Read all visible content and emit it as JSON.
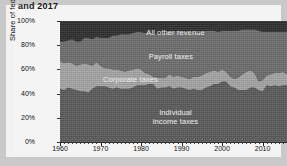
{
  "title": "and 2017",
  "chart_data": {
    "type": "area",
    "title": "and 2017",
    "xlabel": "",
    "ylabel": "Share of federal revenue",
    "xlim": [
      1960,
      2017
    ],
    "ylim": [
      0,
      100
    ],
    "grid": false,
    "legend_position": "inline-labels",
    "stacked": true,
    "x_ticks": [
      "1960",
      "1970",
      "1980",
      "1990",
      "2000",
      "2010"
    ],
    "x_tick_values": [
      1960,
      1970,
      1980,
      1990,
      2000,
      2010
    ],
    "y_ticks": [
      "0%",
      "20%",
      "40%",
      "60%",
      "80%",
      "100%"
    ],
    "y_tick_values": [
      0,
      20,
      40,
      60,
      80,
      100
    ],
    "x": [
      1960,
      1961,
      1962,
      1963,
      1964,
      1965,
      1966,
      1967,
      1968,
      1969,
      1970,
      1971,
      1972,
      1973,
      1974,
      1975,
      1976,
      1977,
      1978,
      1979,
      1980,
      1981,
      1982,
      1983,
      1984,
      1985,
      1986,
      1987,
      1988,
      1989,
      1990,
      1991,
      1992,
      1993,
      1994,
      1995,
      1996,
      1997,
      1998,
      1999,
      2000,
      2001,
      2002,
      2003,
      2004,
      2005,
      2006,
      2007,
      2008,
      2009,
      2010,
      2011,
      2012,
      2013,
      2014,
      2015,
      2016,
      2017
    ],
    "series": [
      {
        "name": "Individual income taxes",
        "color": "#5b5b5b",
        "label_position": "bottom",
        "values": [
          44,
          43,
          45,
          44,
          43,
          42,
          42,
          41,
          44,
          46,
          46,
          46,
          45,
          44,
          45,
          44,
          44,
          44,
          45,
          47,
          47,
          47,
          48,
          48,
          44,
          45,
          45,
          46,
          44,
          45,
          45,
          44,
          43,
          44,
          43,
          43,
          45,
          46,
          48,
          48,
          50,
          50,
          46,
          45,
          43,
          43,
          43,
          45,
          45,
          43,
          42,
          47,
          46,
          47,
          46,
          47,
          47,
          48
        ]
      },
      {
        "name": "Corporate taxes",
        "color": "#a6a6a6",
        "label_position": "middle",
        "values": [
          23,
          22,
          21,
          21,
          20,
          22,
          23,
          23,
          19,
          20,
          17,
          15,
          16,
          16,
          15,
          15,
          14,
          15,
          15,
          14,
          13,
          10,
          8,
          6,
          9,
          8,
          8,
          10,
          10,
          10,
          9,
          9,
          9,
          10,
          11,
          12,
          12,
          12,
          11,
          10,
          10,
          8,
          8,
          7,
          10,
          13,
          15,
          14,
          12,
          7,
          9,
          8,
          10,
          10,
          11,
          11,
          9,
          9
        ]
      },
      {
        "name": "Payroll taxes",
        "color": "#6e6e6e",
        "label_position": "upper",
        "values": [
          16,
          18,
          18,
          20,
          20,
          19,
          21,
          22,
          22,
          21,
          23,
          25,
          25,
          28,
          28,
          30,
          31,
          30,
          30,
          30,
          31,
          33,
          35,
          35,
          36,
          36,
          37,
          35,
          37,
          37,
          37,
          38,
          38,
          37,
          36,
          35,
          35,
          34,
          33,
          33,
          32,
          34,
          38,
          40,
          39,
          37,
          35,
          34,
          36,
          42,
          40,
          36,
          35,
          34,
          34,
          33,
          35,
          35
        ]
      },
      {
        "name": "All other revenue",
        "color": "#2f2f2f",
        "label_position": "top",
        "values": [
          17,
          17,
          16,
          15,
          17,
          17,
          14,
          14,
          15,
          13,
          14,
          14,
          14,
          12,
          12,
          11,
          11,
          11,
          10,
          9,
          9,
          10,
          9,
          11,
          11,
          11,
          10,
          9,
          9,
          8,
          9,
          9,
          10,
          9,
          10,
          10,
          8,
          8,
          8,
          9,
          8,
          8,
          8,
          8,
          8,
          7,
          7,
          7,
          7,
          8,
          9,
          9,
          9,
          9,
          9,
          9,
          9,
          8
        ]
      }
    ],
    "band_labels": [
      {
        "text": "All other revenue",
        "x_frac": 0.5,
        "y_frac": 0.055
      },
      {
        "text": "Payroll taxes",
        "x_frac": 0.48,
        "y_frac": 0.26
      },
      {
        "text": "Corporate taxes",
        "x_frac": 0.305,
        "y_frac": 0.445
      },
      {
        "text": "Individual income taxes",
        "x_frac": 0.5,
        "y_frac": 0.715
      }
    ]
  },
  "colors": {
    "page_background": "#c9c9c9",
    "card_background": "#f4f4f4",
    "plot_background": "#4a4a4a",
    "axis": "#222222",
    "text": "#111111",
    "band_label_text": "#f0f0f0"
  }
}
